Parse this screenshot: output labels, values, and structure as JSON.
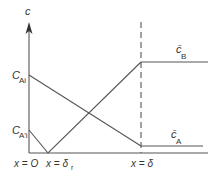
{
  "diagram": {
    "axis_y_label": "c",
    "labels": {
      "c_ai": {
        "base": "C",
        "sub": "Ai"
      },
      "c_a_prime_i": {
        "base": "C",
        "sub": "A'i"
      },
      "c_bar_b": {
        "base": "c̄",
        "sub": "B"
      },
      "c_bar_a": {
        "base": "c̄",
        "sub": "A"
      }
    },
    "x_labels": {
      "x0": "x = O",
      "x_delta_r": {
        "base": "x = δ",
        "sub": "r"
      },
      "x_delta": "x = δ"
    },
    "colors": {
      "line": "#555555",
      "text": "#333333",
      "background": "#ffffff"
    }
  }
}
